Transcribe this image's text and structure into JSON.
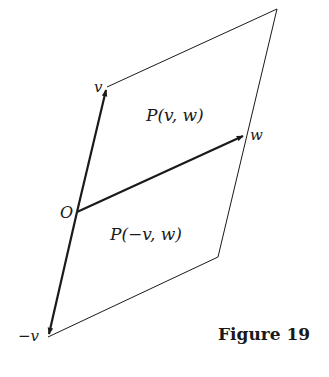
{
  "figure": {
    "caption": "Figure 19",
    "labels": {
      "v": "v",
      "w": "w",
      "origin": "O",
      "neg_v": "−v"
    },
    "regions": {
      "upper": "P(v, w)",
      "lower": "P(−v, w)"
    },
    "colors": {
      "ink": "#1a1a1a",
      "background": "#ffffff"
    }
  }
}
